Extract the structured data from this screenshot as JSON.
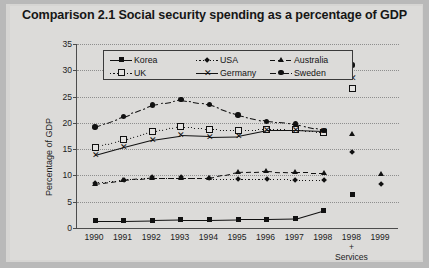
{
  "title": "Comparison 2.1  Social security spending as a percentage of GDP",
  "axis": {
    "ylabel": "Percentage of GDP",
    "yticks": [
      "0",
      "5",
      "10",
      "15",
      "20",
      "25",
      "30",
      "35"
    ],
    "xticks": [
      "1990",
      "1991",
      "1992",
      "1993",
      "1994",
      "1995",
      "1996",
      "1997",
      "1998",
      "1998",
      "1999"
    ],
    "services_note": "+ Services"
  },
  "legend": {
    "items": [
      {
        "label": "Korea",
        "marker": "square-marker",
        "line": "solid"
      },
      {
        "label": "USA",
        "marker": "diamond-marker",
        "line": "dotted"
      },
      {
        "label": "Australia",
        "marker": "triangle-marker",
        "line": "dashed"
      },
      {
        "label": "UK",
        "marker": "open-square-marker",
        "line": "dotted"
      },
      {
        "label": "Germany",
        "marker": "x-marker",
        "line": "solid"
      },
      {
        "label": "Sweden",
        "marker": "circle-marker",
        "line": "dash-dot"
      }
    ]
  },
  "chart_data": {
    "type": "line",
    "title": "Comparison 2.1  Social security spending as a percentage of GDP",
    "xlabel": "",
    "ylabel": "Percentage of GDP",
    "ylim": [
      0,
      35
    ],
    "grid": true,
    "legend_position": "top-inside",
    "categories": [
      "1990",
      "1991",
      "1992",
      "1993",
      "1994",
      "1995",
      "1996",
      "1997",
      "1998",
      "1998 + Services",
      "1999"
    ],
    "series": [
      {
        "name": "Korea",
        "marker": "square-marker",
        "line": "solid",
        "values": [
          1.4,
          1.4,
          1.5,
          1.6,
          1.6,
          1.7,
          1.7,
          1.8,
          3.4,
          6.3,
          null
        ]
      },
      {
        "name": "USA",
        "marker": "diamond-marker",
        "line": "dotted",
        "values": [
          8.6,
          9.2,
          9.6,
          9.6,
          9.4,
          9.3,
          9.3,
          9.2,
          9.1,
          14.5,
          8.3
        ]
      },
      {
        "name": "Australia",
        "marker": "triangle-marker",
        "line": "dashed",
        "values": [
          8.4,
          9.1,
          9.6,
          9.6,
          9.5,
          10.6,
          10.8,
          10.6,
          10.5,
          17.9,
          10.2
        ]
      },
      {
        "name": "UK",
        "marker": "open-square-marker",
        "line": "dotted",
        "values": [
          15.4,
          16.8,
          18.4,
          19.3,
          18.8,
          18.6,
          18.8,
          18.7,
          18.2,
          26.5,
          null
        ]
      },
      {
        "name": "Germany",
        "marker": "x-marker",
        "line": "solid",
        "values": [
          13.9,
          15.4,
          16.8,
          17.6,
          17.4,
          17.5,
          18.6,
          18.6,
          18.4,
          28.5,
          null
        ]
      },
      {
        "name": "Sweden",
        "marker": "circle-marker",
        "line": "dash-dot",
        "values": [
          19.2,
          21.2,
          23.4,
          24.4,
          23.5,
          21.5,
          20.3,
          19.8,
          18.6,
          31.0,
          null
        ]
      }
    ]
  }
}
